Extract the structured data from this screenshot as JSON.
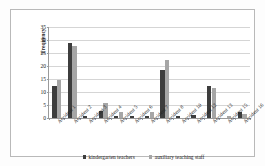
{
  "chart_data": {
    "type": "bar",
    "title": "",
    "xlabel": "",
    "ylabel": "Frequency",
    "ylim": [
      0,
      35
    ],
    "yticks": [
      0,
      5,
      10,
      15,
      20,
      25,
      30,
      35
    ],
    "grid": true,
    "legend_position": "bottom",
    "categories": [
      "Accident 1",
      "Accident 2",
      "Accident 3",
      "Accident 4",
      "Accident 5",
      "Accident 6",
      "Accident 7",
      "Accident 8",
      "Accident 10",
      "Accident 12",
      "Accident 13",
      "Accident 15",
      "Accident 16"
    ],
    "series": [
      {
        "name": "kindergarten teachers",
        "color": "#3d3d3d",
        "values": [
          12.5,
          29,
          0.6,
          2.8,
          0.6,
          0.6,
          0.6,
          18.5,
          0.6,
          1.2,
          12.3,
          0,
          2.3
        ]
      },
      {
        "name": "auxiliary teaching staff",
        "color": "#a6a6a6",
        "values": [
          14.5,
          27.6,
          0,
          5.6,
          2.4,
          0,
          2.2,
          22.4,
          0,
          0,
          11.5,
          0.6,
          1.4
        ]
      }
    ]
  },
  "legend": {
    "items": [
      {
        "label": "kindergarten teachers"
      },
      {
        "label": "auxiliary teaching staff"
      }
    ]
  }
}
